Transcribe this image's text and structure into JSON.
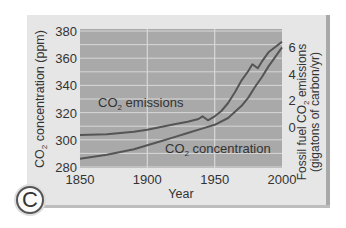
{
  "panel_label": "C",
  "chart_data": {
    "type": "line",
    "title": "",
    "xlabel": "Year",
    "ylabel_left": "CO2 concentration (ppm)",
    "ylabel_right": "Fossil fuel CO2 emissions (gigatons of carbon/yr)",
    "x_ticks": [
      1850,
      1900,
      1950,
      2000
    ],
    "y_left_ticks": [
      280,
      300,
      320,
      340,
      360,
      380
    ],
    "y_right_ticks": [
      0,
      2,
      4,
      6
    ],
    "xlim": [
      1850,
      2000
    ],
    "ylim_left": [
      280,
      380
    ],
    "ylim_right": [
      -1.2,
      7.2
    ],
    "grid": true,
    "series": [
      {
        "name": "CO2 emissions",
        "axis": "right",
        "x": [
          1850,
          1870,
          1890,
          1900,
          1910,
          1920,
          1930,
          1938,
          1941,
          1945,
          1950,
          1955,
          1960,
          1965,
          1970,
          1975,
          1978,
          1982,
          1985,
          1990,
          1995,
          2000
        ],
        "values": [
          -0.6,
          -0.55,
          -0.35,
          -0.2,
          0.0,
          0.2,
          0.4,
          0.6,
          0.8,
          0.5,
          0.8,
          1.2,
          1.8,
          2.6,
          3.5,
          4.2,
          4.7,
          4.4,
          4.9,
          5.6,
          6.0,
          6.4
        ]
      },
      {
        "name": "CO2 concentration",
        "axis": "left",
        "x": [
          1850,
          1870,
          1890,
          1900,
          1910,
          1920,
          1930,
          1940,
          1950,
          1960,
          1970,
          1975,
          1980,
          1985,
          1990,
          1995,
          2000
        ],
        "values": [
          286,
          289,
          293,
          296,
          299,
          302,
          305,
          308,
          311,
          316,
          325,
          331,
          339,
          346,
          354,
          361,
          368
        ]
      }
    ],
    "annotations": [
      {
        "text": "CO2 emissions",
        "x": 1860,
        "y_left": 328
      },
      {
        "text": "CO2 concentration",
        "x": 1942,
        "y_left": 296
      }
    ]
  },
  "colors": {
    "plot_bg": "#a9a9a9",
    "grid": "#d8d8d8",
    "line": "#555555",
    "card_bg": "#e6e6e6",
    "text": "#333333"
  }
}
